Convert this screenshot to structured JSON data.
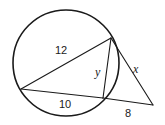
{
  "diagram": {
    "type": "circle-secant-geometry",
    "colors": {
      "stroke": "#1a1a1a",
      "background": "#ffffff"
    },
    "circle": {
      "cx": 66,
      "cy": 63,
      "r": 53
    },
    "points": {
      "A": {
        "x": 21,
        "y": 89
      },
      "B": {
        "x": 111,
        "y": 38
      },
      "C": {
        "x": 103,
        "y": 98
      },
      "P": {
        "x": 153,
        "y": 105
      }
    },
    "segments": [
      {
        "id": "AB",
        "from": "A",
        "to": "B",
        "label": "12"
      },
      {
        "id": "BC",
        "from": "B",
        "to": "C",
        "label": "y"
      },
      {
        "id": "AC",
        "from": "A",
        "to": "C",
        "label": "10"
      },
      {
        "id": "CP",
        "from": "C",
        "to": "P",
        "label": "8"
      },
      {
        "id": "BP",
        "from": "B",
        "to": "P",
        "label": "x"
      }
    ],
    "labels": {
      "ab": "12",
      "bc": "y",
      "ac": "10",
      "cp": "8",
      "bp": "x"
    }
  }
}
